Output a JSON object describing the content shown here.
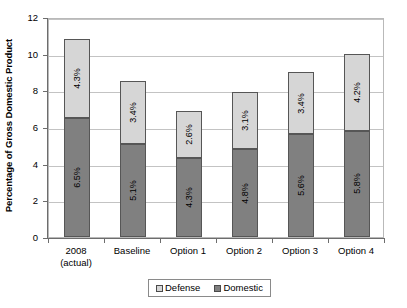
{
  "chart_data": {
    "type": "bar",
    "subtype": "stacked-bar",
    "title": "",
    "xlabel": "",
    "ylabel": "Percentage of Gross Domestic Product",
    "ylim": [
      0,
      12
    ],
    "yticks": [
      0,
      2,
      4,
      6,
      8,
      10,
      12
    ],
    "ytick_labels": [
      "0",
      "2",
      "4",
      "6",
      "8",
      "10",
      "12"
    ],
    "grid": "horizontal",
    "legend_position": "bottom",
    "categories": [
      "2008 (actual)",
      "Baseline",
      "Option 1",
      "Option 2",
      "Option 3",
      "Option 4"
    ],
    "category_lines": [
      [
        "2008",
        "(actual)"
      ],
      [
        "Baseline",
        ""
      ],
      [
        "Option 1",
        ""
      ],
      [
        "Option 2",
        ""
      ],
      [
        "Option 3",
        ""
      ],
      [
        "Option 4",
        ""
      ]
    ],
    "series": [
      {
        "name": "Domestic",
        "color": "#808080",
        "values": [
          6.5,
          5.1,
          4.3,
          4.8,
          5.6,
          5.8
        ],
        "labels": [
          "6.5%",
          "5.1%",
          "4.3%",
          "4.8%",
          "5.6%",
          "5.8%"
        ]
      },
      {
        "name": "Defense",
        "color": "#d6d6d6",
        "values": [
          4.3,
          3.4,
          2.6,
          3.1,
          3.4,
          4.2
        ],
        "labels": [
          "4.3%",
          "3.4%",
          "2.6%",
          "3.1%",
          "3.4%",
          "4.2%"
        ]
      }
    ],
    "totals": [
      10.8,
      8.5,
      6.9,
      7.9,
      9.0,
      10.0
    ]
  },
  "legend": {
    "items": [
      {
        "label": "Defense",
        "color": "#d6d6d6"
      },
      {
        "label": "Domestic",
        "color": "#808080"
      }
    ]
  }
}
